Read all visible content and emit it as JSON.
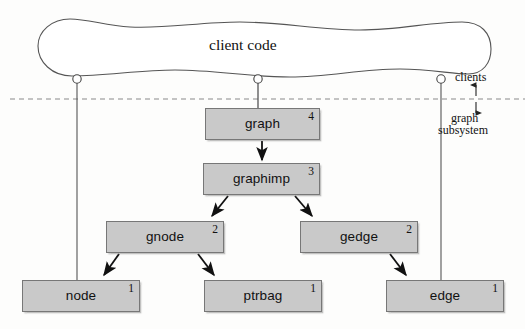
{
  "diagram": {
    "title": "client code",
    "region_labels": {
      "above": "clients",
      "below_line1": "graph",
      "below_line2": "subsystem"
    },
    "boxes": [
      {
        "id": "graph",
        "label": "graph",
        "badge": "4"
      },
      {
        "id": "graphimp",
        "label": "graphimp",
        "badge": "3"
      },
      {
        "id": "gnode",
        "label": "gnode",
        "badge": "2"
      },
      {
        "id": "gedge",
        "label": "gedge",
        "badge": "2"
      },
      {
        "id": "node",
        "label": "node",
        "badge": "1"
      },
      {
        "id": "ptrbag",
        "label": "ptrbag",
        "badge": "1"
      },
      {
        "id": "edge",
        "label": "edge",
        "badge": "1"
      }
    ],
    "colors": {
      "box_fill": "#c9c9c9",
      "box_stroke": "#777777",
      "line": "#444444",
      "arrow": "#111111",
      "dashed_divider": "#8a8a8a",
      "background": "#fdfdfc"
    }
  }
}
